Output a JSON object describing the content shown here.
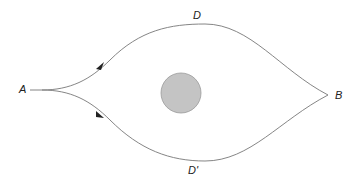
{
  "diagram": {
    "labels": {
      "start": "A",
      "end": "B",
      "upper": "D",
      "lower": "D'"
    },
    "colors": {
      "path": "#777777",
      "arrow": "#222222",
      "obstacle_fill": "#c4c4c4",
      "obstacle_stroke": "#9a9a9a",
      "text": "#222222"
    }
  }
}
